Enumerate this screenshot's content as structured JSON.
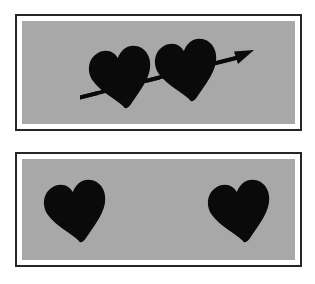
{
  "figure": {
    "background_color": "#ffffff",
    "width": 315,
    "height": 284,
    "panel_count": 2
  },
  "style": {
    "plate_fill": "#a8a8a8",
    "frame_border_color": "#262626",
    "frame_inner_gap_color": "#ffffff",
    "shape_color": "#0a0a0a",
    "frame_border_width_px": 2,
    "frame_inner_gap_px": 7
  },
  "panels": [
    {
      "id": "panel-top",
      "name": "pierced-hearts-panel",
      "caption": "",
      "plate_fill": "#a8a8a8",
      "bounds": {
        "x": 15,
        "y": 14,
        "width": 287,
        "height": 117
      },
      "plate_bounds": {
        "x": 7,
        "y": 7,
        "width": 273,
        "height": 103
      },
      "has_arrow": true,
      "heart_count": 2,
      "hearts": [
        {
          "name": "heart-left",
          "cx": 97,
          "cy": 52,
          "scale": 1.0,
          "rotation_deg": -8
        },
        {
          "name": "heart-right",
          "cx": 163,
          "cy": 45,
          "scale": 1.0,
          "rotation_deg": -8
        }
      ],
      "arrow": {
        "name": "cupid-arrow",
        "tail_x": 58,
        "tail_y": 73,
        "tip_x": 232,
        "tip_y": 29,
        "shaft_thickness": 3,
        "head_length": 17,
        "head_half_width": 7,
        "direction": "lower-left to upper-right"
      }
    },
    {
      "id": "panel-bottom",
      "name": "separated-hearts-panel",
      "caption": "",
      "plate_fill": "#a8a8a8",
      "bounds": {
        "x": 15,
        "y": 152,
        "width": 287,
        "height": 115
      },
      "plate_bounds": {
        "x": 7,
        "y": 7,
        "width": 273,
        "height": 101
      },
      "has_arrow": false,
      "heart_count": 2,
      "hearts": [
        {
          "name": "heart-left",
          "cx": 52,
          "cy": 48,
          "scale": 1.0,
          "rotation_deg": -8
        },
        {
          "name": "heart-right",
          "cx": 216,
          "cy": 48,
          "scale": 1.0,
          "rotation_deg": -8
        }
      ]
    }
  ]
}
